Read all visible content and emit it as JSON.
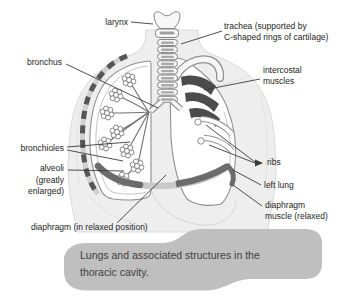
{
  "figure": {
    "caption": "Lungs and associated structures in the\nthoracic cavity.",
    "labels": {
      "larynx": "larynx",
      "trachea": "trachea (supported by\nC-shaped rings of cartilage)",
      "bronchus": "bronchus",
      "intercostal_muscles": "intercostal\nmuscles",
      "bronchioles": "bronchioles",
      "alveoli": "alveoli\n(greatly\nenlarged)",
      "ribs": "ribs",
      "left_lung": "left lung",
      "diaphragm_muscle": "diaphragm\nmuscle (relaxed)",
      "diaphragm": "diaphragm (in relaxed position)"
    },
    "colors": {
      "caption_background": "#bfbfbf",
      "label_text": "#1e1e1e",
      "leader_line": "#3b3b3b",
      "muscle_dark": "#4c4c4c",
      "diaphragm_band": "#6b6b6b",
      "body_silhouette": "#eeeeee"
    }
  }
}
